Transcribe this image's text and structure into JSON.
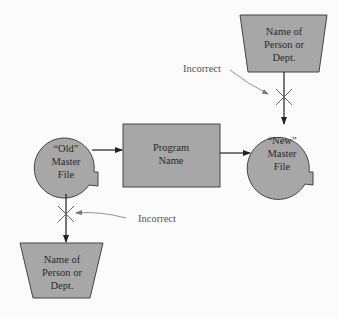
{
  "diagram": {
    "nodes": {
      "old_master_file": {
        "shape": "file",
        "lines": [
          "“Old”",
          "Master",
          "File"
        ]
      },
      "program": {
        "shape": "process",
        "lines": [
          "Program",
          "Name"
        ]
      },
      "new_master_file": {
        "shape": "file",
        "lines": [
          "“New”",
          "Master",
          "File"
        ]
      },
      "dept_top": {
        "shape": "manual-operation",
        "lines": [
          "Name of",
          "Person or",
          "Dept."
        ]
      },
      "dept_bottom": {
        "shape": "manual-operation",
        "lines": [
          "Name of",
          "Person or",
          "Dept."
        ]
      }
    },
    "edges": [
      {
        "from": "old_master_file",
        "to": "program"
      },
      {
        "from": "program",
        "to": "new_master_file"
      },
      {
        "from": "dept_top",
        "to": "new_master_file",
        "crossed": true
      },
      {
        "from": "old_master_file",
        "to": "dept_bottom",
        "crossed": true
      }
    ],
    "annotations": {
      "top": "Incorrect",
      "bottom": "Incorrect"
    },
    "colors": {
      "fill": "#a7a7a7",
      "stroke": "#333333",
      "background": "#fbfbfb"
    }
  }
}
